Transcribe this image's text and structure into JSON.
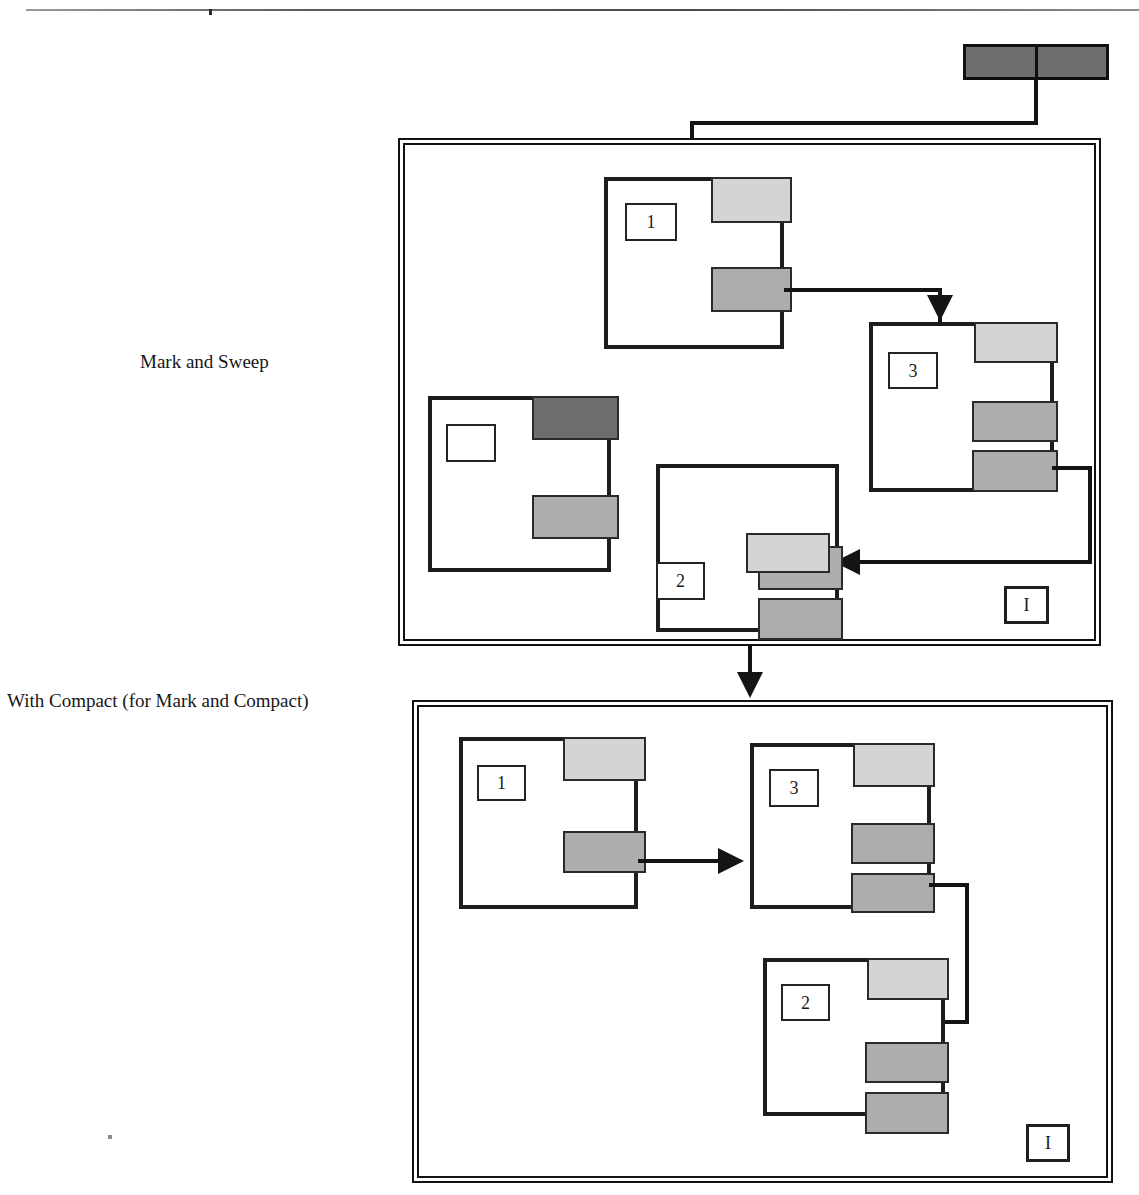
{
  "figure": {
    "captions": {
      "mark_sweep": "Mark and Sweep",
      "with_compact": "With Compact (for Mark and Compact)"
    },
    "root_set": {
      "name": "root-set",
      "cells": [
        "",
        ""
      ],
      "fill": "#6e6e6e"
    },
    "panels": [
      {
        "id": "mark-sweep",
        "caption": "Mark and Sweep",
        "tag": "I",
        "objects": [
          {
            "id": "obj-1",
            "label": "1",
            "slots": [
              {
                "tone": "light",
                "value": ""
              },
              {
                "tone": "mid",
                "value": ""
              }
            ]
          },
          {
            "id": "obj-3",
            "label": "3",
            "slots": [
              {
                "tone": "light",
                "value": ""
              },
              {
                "tone": "mid",
                "value": ""
              },
              {
                "tone": "mid",
                "value": ""
              }
            ]
          },
          {
            "id": "obj-garbage",
            "label": "",
            "slots": [
              {
                "tone": "dark",
                "value": ""
              },
              {
                "tone": "mid",
                "value": ""
              }
            ]
          },
          {
            "id": "obj-2",
            "label": "2",
            "slots": [
              {
                "tone": "mid",
                "value": ""
              },
              {
                "tone": "light",
                "value": ""
              },
              {
                "tone": "mid",
                "value": ""
              }
            ]
          }
        ]
      },
      {
        "id": "with-compact",
        "caption": "With Compact (for Mark and Compact)",
        "tag": "I",
        "objects": [
          {
            "id": "obj-1",
            "label": "1",
            "slots": [
              {
                "tone": "light",
                "value": ""
              },
              {
                "tone": "mid",
                "value": ""
              }
            ]
          },
          {
            "id": "obj-3",
            "label": "3",
            "slots": [
              {
                "tone": "light",
                "value": ""
              },
              {
                "tone": "mid",
                "value": ""
              },
              {
                "tone": "mid",
                "value": ""
              }
            ]
          },
          {
            "id": "obj-2",
            "label": "2",
            "slots": [
              {
                "tone": "light",
                "value": ""
              },
              {
                "tone": "mid",
                "value": ""
              },
              {
                "tone": "mid",
                "value": ""
              }
            ]
          }
        ]
      }
    ],
    "colors": {
      "stroke": "#141414",
      "slot_light": "#d4d4d4",
      "slot_mid": "#adadad",
      "slot_dark": "#6e6e6e",
      "background": "#ffffff"
    },
    "edges": [
      {
        "from": "root-set",
        "to": "mark-sweep/obj-1",
        "style": "elbow-down"
      },
      {
        "from": "mark-sweep/obj-1",
        "to": "mark-sweep/obj-3",
        "style": "elbow-down"
      },
      {
        "from": "mark-sweep/obj-3",
        "to": "mark-sweep/obj-2",
        "style": "elbow-left"
      },
      {
        "from": "mark-sweep",
        "to": "with-compact",
        "style": "down"
      },
      {
        "from": "with-compact/obj-1",
        "to": "with-compact/obj-3",
        "style": "straight-right"
      },
      {
        "from": "with-compact/obj-3",
        "to": "with-compact/obj-2",
        "style": "elbow-left"
      }
    ]
  }
}
